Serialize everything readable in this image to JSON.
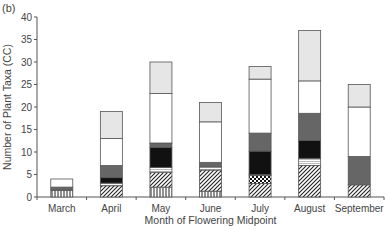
{
  "panel_label": "(b)",
  "chart_data": {
    "type": "bar",
    "stacked": true,
    "title": "",
    "xlabel": "Month of Flowering Midpoint",
    "ylabel": "Number of Plant Taxa (CC)",
    "ylim": [
      0,
      40
    ],
    "yticks": [
      0,
      5,
      10,
      15,
      20,
      25,
      30,
      35,
      40
    ],
    "grid": false,
    "legend": "none",
    "categories": [
      "March",
      "April",
      "May",
      "June",
      "July",
      "August",
      "September"
    ],
    "series": [
      {
        "name": "vertical-hatch",
        "pattern": "vlines",
        "values": [
          1.5,
          0,
          2.2,
          1.3,
          0,
          0,
          0
        ]
      },
      {
        "name": "diagonal-hatch",
        "pattern": "diag",
        "values": [
          0,
          2.5,
          3.3,
          4.7,
          3.0,
          7.0,
          2.7
        ]
      },
      {
        "name": "dotted",
        "pattern": "dots",
        "values": [
          0,
          0,
          0,
          0,
          1.8,
          0,
          0
        ]
      },
      {
        "name": "light-stripe",
        "pattern": "light",
        "values": [
          0,
          0.6,
          1.1,
          0.7,
          0.2,
          1.6,
          0
        ]
      },
      {
        "name": "black",
        "color": "#111111",
        "values": [
          0,
          1.2,
          4.4,
          0,
          5.2,
          4.0,
          0
        ]
      },
      {
        "name": "dark-grey",
        "color": "#666666",
        "values": [
          0.7,
          2.7,
          1.0,
          1.0,
          4.0,
          6.0,
          6.3
        ]
      },
      {
        "name": "white",
        "color": "#ffffff",
        "values": [
          1.8,
          6.0,
          11.0,
          9.0,
          12.0,
          7.2,
          11.0
        ]
      },
      {
        "name": "light-grey",
        "color": "#e6e6e6",
        "values": [
          0,
          6.0,
          7.0,
          4.3,
          2.8,
          11.2,
          5.0
        ]
      }
    ],
    "totals": [
      4,
      19,
      30,
      21,
      29,
      37,
      25
    ]
  }
}
